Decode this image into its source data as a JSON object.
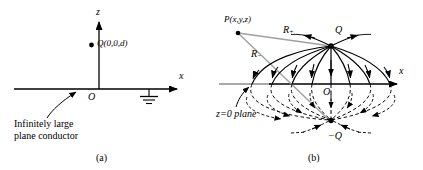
{
  "figure": {
    "background": "#ffffff",
    "line_color": "#000000",
    "gray_color": "#999999",
    "width": 423,
    "height": 170
  },
  "panel_a": {
    "caption": "(a)",
    "axis_z_label": "z",
    "axis_x_label": "x",
    "origin_label": "O",
    "charge_label": "Q(0,0,d)",
    "conductor_label_line1": "Infinitely large",
    "conductor_label_line2": "plane conductor",
    "ground_symbol": "ground-icon",
    "charge_dot": "point-charge-dot"
  },
  "panel_b": {
    "caption": "(b)",
    "axis_x_label": "x",
    "origin_label": "O",
    "field_point_label": "P(x,y,z)",
    "distance_plus_label": "R",
    "distance_plus_sub": "+",
    "distance_minus_label": "R",
    "distance_minus_sub": "−",
    "charge_label": "Q",
    "image_charge_label": "−Q",
    "plane_label": "z=0 plane",
    "charge_dot": "point-charge-dot",
    "image_charge_dot": "image-charge-dot",
    "field_point_dot": "field-point-dot"
  }
}
